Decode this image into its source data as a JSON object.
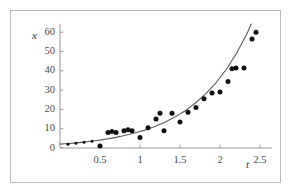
{
  "figure": {
    "frame_color": "#b9b9b9",
    "background": "#ffffff",
    "axis_color": "#8a8a8a",
    "curve_color": "#5a5a5a",
    "point_color": "#111111",
    "x_axis_label": "t",
    "y_axis_label": "x"
  },
  "chart_data": {
    "type": "scatter",
    "title": "",
    "xlabel": "t",
    "ylabel": "x",
    "xlim": [
      0,
      2.6
    ],
    "ylim": [
      0,
      64
    ],
    "grid": false,
    "legend": "none",
    "xticks": [
      0.5,
      1,
      1.5,
      2,
      2.5
    ],
    "xtick_labels": [
      "0.5",
      "1",
      "1.5",
      "2",
      "2.5"
    ],
    "yticks": [
      0,
      10,
      20,
      30,
      40,
      50,
      60
    ],
    "ytick_labels": [
      "0",
      "10",
      "20",
      "30",
      "40",
      "50",
      "60"
    ],
    "series": [
      {
        "name": "data points",
        "type": "scatter",
        "marker": "filled-circle",
        "x": [
          0.1,
          0.2,
          0.3,
          0.4,
          0.5,
          0.6,
          0.65,
          0.7,
          0.8,
          0.85,
          0.9,
          1.0,
          1.1,
          1.2,
          1.25,
          1.3,
          1.4,
          1.5,
          1.6,
          1.7,
          1.8,
          1.9,
          2.0,
          2.1,
          2.15,
          2.2,
          2.3,
          2.4,
          2.45
        ],
        "y": [
          2.0,
          2.5,
          3.0,
          3.5,
          1.0,
          8.0,
          8.5,
          8.0,
          9.0,
          9.5,
          9.0,
          5.5,
          10.5,
          15.0,
          18.0,
          9.0,
          18.0,
          13.5,
          18.5,
          21.0,
          25.5,
          28.5,
          29.0,
          34.5,
          41.0,
          41.5,
          41.5,
          56.5,
          60.0
        ]
      },
      {
        "name": "fitted exponential curve",
        "type": "line",
        "x": [
          0.0,
          0.13,
          0.26,
          0.39,
          0.52,
          0.65,
          0.78,
          0.91,
          1.04,
          1.17,
          1.3,
          1.43,
          1.56,
          1.69,
          1.82,
          1.95,
          2.08,
          2.21,
          2.34,
          2.47,
          2.55
        ],
        "y": [
          2.0,
          2.4,
          2.9,
          3.5,
          4.2,
          5.1,
          6.2,
          7.5,
          9.0,
          10.9,
          13.1,
          15.9,
          19.2,
          23.2,
          28.0,
          33.8,
          40.8,
          49.3,
          59.5,
          71.8,
          80.0
        ]
      }
    ]
  }
}
